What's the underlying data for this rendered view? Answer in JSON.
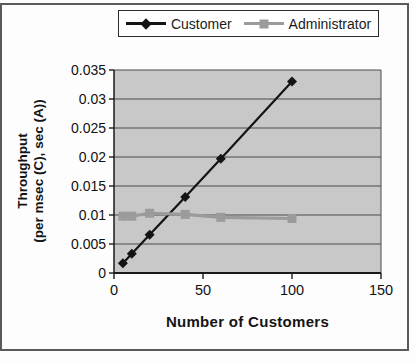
{
  "figure": {
    "background": "#fdfdfd",
    "border_color": "#5a5a5a"
  },
  "chart_data": {
    "type": "line",
    "title": "",
    "xlabel": "Number of Customers",
    "ylabel": "Throughput (per msec (C), sec (A))",
    "ylabel_lines": [
      "Throughput",
      "(per msec (C), sec (A))"
    ],
    "xlim": [
      0,
      150
    ],
    "ylim": [
      0,
      0.035
    ],
    "x_ticks": [
      0,
      50,
      100,
      150
    ],
    "x_tick_labels": [
      "0",
      "50",
      "100",
      "150"
    ],
    "y_ticks": [
      0,
      0.005,
      0.01,
      0.015,
      0.02,
      0.025,
      0.03,
      0.035
    ],
    "y_tick_labels": [
      "0",
      "0.005",
      "0.01",
      "0.015",
      "0.02",
      "0.025",
      "0.03",
      "0.035"
    ],
    "grid": "horizontal",
    "plot_bg": "#c8c8c8",
    "gridline_color": "#4a4a4a",
    "axis_color": "#1a1a1a",
    "legend_position": "top-center",
    "series": [
      {
        "name": "Customer",
        "marker": "diamond",
        "color": "#141414",
        "x": [
          5,
          10,
          20,
          40,
          60,
          100
        ],
        "y": [
          0.0017,
          0.0033,
          0.0066,
          0.0131,
          0.0197,
          0.033
        ]
      },
      {
        "name": "Administrator",
        "marker": "square",
        "color": "#9b9b9b",
        "x": [
          5,
          10,
          20,
          40,
          60,
          100
        ],
        "y": [
          0.0098,
          0.0098,
          0.0103,
          0.0101,
          0.0096,
          0.0094
        ]
      }
    ]
  }
}
